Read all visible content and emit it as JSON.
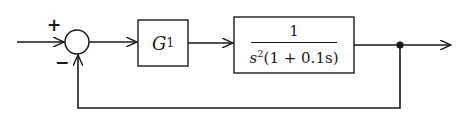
{
  "diagram": {
    "type": "feedback-block-diagram",
    "summing_junction": {
      "plus_sign": "+",
      "minus_sign": "−"
    },
    "blocks": [
      {
        "id": "controller",
        "name": "G",
        "subscript": "1"
      },
      {
        "id": "plant",
        "numerator": "1",
        "denominator_base": "s",
        "denominator_power": "2",
        "denominator_rest": "(1 + 0.1s)"
      }
    ],
    "colors": {
      "line": "#1a1a1a",
      "background": "#ffffff"
    }
  }
}
